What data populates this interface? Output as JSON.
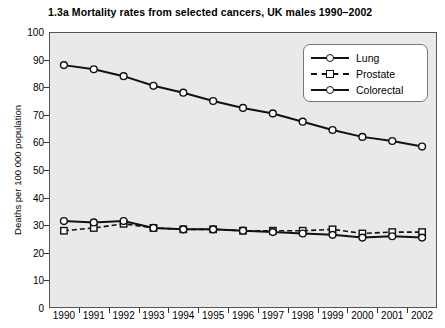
{
  "chart_data": {
    "type": "line",
    "title": "1.3a  Mortality rates from selected cancers, UK males 1990–2002",
    "xlabel": "",
    "ylabel": "Deaths per 100 000 population",
    "categories": [
      "1990",
      "1991",
      "1992",
      "1993",
      "1994",
      "1995",
      "1996",
      "1997",
      "1998",
      "1999",
      "2000",
      "2001",
      "2002"
    ],
    "x": [
      1990,
      1991,
      1992,
      1993,
      1994,
      1995,
      1996,
      1997,
      1998,
      1999,
      2000,
      2001,
      2002
    ],
    "ylim": [
      0,
      100
    ],
    "y_ticks": [
      0,
      10,
      20,
      30,
      40,
      50,
      60,
      70,
      80,
      90,
      100
    ],
    "grid": false,
    "legend_position": "top-right",
    "series": [
      {
        "name": "Lung",
        "marker": "circle",
        "line_style": "solid",
        "color": "#111111",
        "values": [
          88,
          86.5,
          84,
          80.5,
          78,
          75,
          72.5,
          70.5,
          67.5,
          64.5,
          62,
          60.5,
          58.5
        ]
      },
      {
        "name": "Prostate",
        "marker": "square",
        "line_style": "dashed",
        "color": "#111111",
        "values": [
          28,
          29,
          30.5,
          29,
          28.5,
          28.5,
          28,
          28,
          28,
          28.5,
          27,
          27.5,
          27.5
        ]
      },
      {
        "name": "Colorectal",
        "marker": "circle",
        "line_style": "solid",
        "color": "#111111",
        "values": [
          31.5,
          31,
          31.5,
          29,
          28.5,
          28.5,
          28,
          27.5,
          27,
          26.5,
          25.5,
          26,
          25.5
        ]
      }
    ]
  },
  "legend": {
    "entries": [
      {
        "label": "Lung"
      },
      {
        "label": "Prostate"
      },
      {
        "label": "Colorectal"
      }
    ]
  }
}
